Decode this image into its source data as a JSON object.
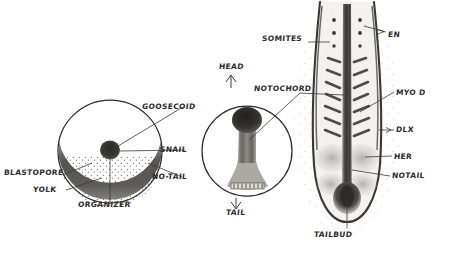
{
  "figure": {
    "background_color": "#ffffff",
    "ink_color": "#2b2b2b",
    "panels": [
      {
        "id": "blastula",
        "name": "early gastrula cross-section",
        "cx": 110,
        "cy": 152,
        "r": 52
      },
      {
        "id": "gastrula",
        "name": "mid gastrula dorsal view",
        "cx": 247,
        "cy": 152,
        "r": 45
      },
      {
        "id": "segmented",
        "name": "segmentation stage embryo",
        "cx": 347,
        "cy": 120
      }
    ]
  },
  "labels": {
    "blastopore": {
      "text": "BLASTOPORE",
      "x": 4,
      "y": 172
    },
    "yolk": {
      "text": "YOLK",
      "x": 33,
      "y": 189
    },
    "organizer": {
      "text": "ORGANIZER",
      "x": 78,
      "y": 204
    },
    "goosecoid": {
      "text": "GOOSECOID",
      "x": 142,
      "y": 106
    },
    "snail": {
      "text": "SNAIL",
      "x": 160,
      "y": 148
    },
    "no_tail": {
      "text": "NO-TAIL",
      "x": 152,
      "y": 175
    },
    "head": {
      "text": "HEAD",
      "x": 219,
      "y": 66
    },
    "tail": {
      "text": "TAIL",
      "x": 226,
      "y": 212
    },
    "notochord": {
      "text": "NOTOCHORD",
      "x": 254,
      "y": 88
    },
    "somites": {
      "text": "SOMITES",
      "x": 262,
      "y": 38
    },
    "en": {
      "text": "EN",
      "x": 388,
      "y": 34
    },
    "myo_d": {
      "text": "MYO D",
      "x": 396,
      "y": 92
    },
    "dlx": {
      "text": "DLX",
      "x": 396,
      "y": 129
    },
    "her": {
      "text": "HER",
      "x": 394,
      "y": 156
    },
    "notail": {
      "text": "NOTAIL",
      "x": 392,
      "y": 175
    },
    "tailbud": {
      "text": "TAILBUD",
      "x": 314,
      "y": 234
    }
  },
  "colors": {
    "ink": "#2b2b2b",
    "stipple": "#8a8a8a",
    "band_dark": "#4a4845",
    "band_mid": "#6e6b66",
    "organizer_blob": "#3a3835",
    "tissue_grey": "#b9b6b1",
    "tissue_light": "#d6d4d0",
    "somite_dark": "#5c5a56"
  }
}
